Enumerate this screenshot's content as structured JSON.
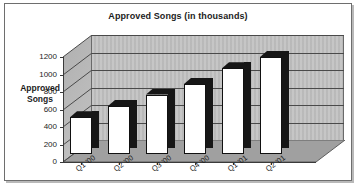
{
  "chart_data": {
    "type": "bar",
    "title": "Approved Songs (in thousands)",
    "xlabel": "",
    "ylabel": "Approved Songs",
    "categories": [
      "Q1 '00",
      "Q2 '00",
      "Q3 '00",
      "Q4 '00",
      "Q1 '01",
      "Q2 '01"
    ],
    "values": [
      420,
      550,
      680,
      800,
      980,
      1110
    ],
    "ylim": [
      0,
      1200
    ],
    "yticks": [
      0,
      200,
      400,
      600,
      800,
      1000,
      1200
    ],
    "ytick_labels": [
      "0",
      "200",
      "400",
      "600",
      "800",
      "1000",
      "1200"
    ],
    "grid": true,
    "legend": false,
    "legend_position": "none",
    "style": "3d-column",
    "colors": {
      "bar_face": "#ffffff",
      "bar_side": "#161616",
      "wall": "#bdbdbd",
      "floor": "#a0a0a0",
      "gridline": "#4a4a4a",
      "text": "#1c1c1c",
      "frame_border": "#6e6e6e"
    }
  }
}
